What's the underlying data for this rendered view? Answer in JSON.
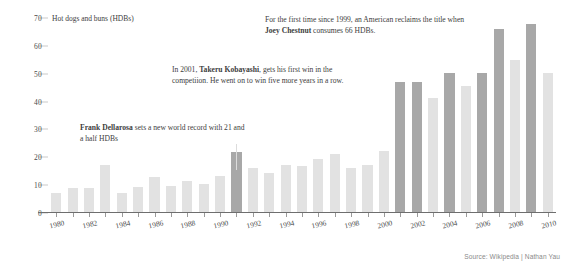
{
  "chart_data": {
    "type": "bar",
    "title": "",
    "axis_caption": "Hot dogs and buns (HDBs)",
    "xlabel": "",
    "ylabel": "Hot dogs and buns (HDBs)",
    "ylim": [
      0,
      70
    ],
    "yticks": [
      0,
      10,
      20,
      30,
      40,
      50,
      60,
      70
    ],
    "ytick_labels": [
      "0",
      "10",
      "20",
      "30",
      "40",
      "50",
      "60",
      "70"
    ],
    "grid": false,
    "legend": "none",
    "xtick_labels": [
      "1980",
      "1982",
      "1984",
      "1986",
      "1988",
      "1990",
      "1992",
      "1994",
      "1996",
      "1998",
      "2000",
      "2002",
      "2004",
      "2006",
      "2008",
      "2010"
    ],
    "categories": [
      1980,
      1981,
      1982,
      1983,
      1984,
      1985,
      1986,
      1987,
      1988,
      1989,
      1990,
      1991,
      1992,
      1993,
      1994,
      1995,
      1996,
      1997,
      1998,
      1999,
      2000,
      2001,
      2002,
      2003,
      2004,
      2005,
      2006,
      2007,
      2008,
      2009,
      2010
    ],
    "values": [
      7,
      8.5,
      8.5,
      17,
      7,
      9,
      12.75,
      9.25,
      11.25,
      10,
      13,
      21.5,
      16,
      14,
      17,
      16.5,
      19,
      21,
      16,
      17,
      22,
      47,
      47,
      41,
      50,
      45.5,
      50,
      66,
      55,
      68,
      50
    ],
    "highlight_years": [
      1991,
      2001,
      2002,
      2004,
      2006,
      2007,
      2009
    ],
    "colors": {
      "bar": "#e2e2e2",
      "bar_highlight": "#a8a8a8",
      "axis": "#6e6e6e",
      "text": "#3d3d3d"
    }
  },
  "annotations": {
    "dellarosa": {
      "bold": "Frank Dellarosa",
      "rest": " sets a new world record with 21 and a half HDBs"
    },
    "kobayashi": {
      "lead": "In 2001, ",
      "bold": "Takeru Kobayashi",
      "rest": ", gets his first win in the competiion. He went on to win five more years in a row."
    },
    "chestnut": {
      "lead": "For the first time since 1999, an American reclaims the title when ",
      "bold": "Joey Chestnut",
      "rest": " consumes 66 HDBs."
    }
  },
  "source": "Source: Wikipedia | Nathan Yau"
}
